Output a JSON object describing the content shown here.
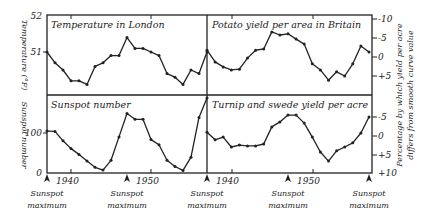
{
  "chart_data": {
    "type": "line",
    "x": [
      1937,
      1938,
      1939,
      1940,
      1941,
      1942,
      1943,
      1944,
      1945,
      1946,
      1947,
      1948,
      1949,
      1950,
      1951,
      1952,
      1953,
      1954,
      1955,
      1956,
      1957
    ],
    "x_tick_labels": [
      "1940",
      "1950"
    ],
    "sunspot_maxima_label": [
      "Sunspot",
      "maximum"
    ],
    "sunspot_maxima_x": [
      1937,
      1947,
      1957
    ],
    "panels": [
      {
        "id": "temperature",
        "title": "Temperature in London",
        "ylabel": "Temperature (°F)",
        "ytick_labels": [
          "52",
          "51"
        ],
        "ylim": [
          49.8,
          52
        ],
        "axis_side": "left",
        "values": [
          51.0,
          50.7,
          50.5,
          50.2,
          50.2,
          50.1,
          50.6,
          50.7,
          50.9,
          50.9,
          51.4,
          51.1,
          51.1,
          51.0,
          50.9,
          50.4,
          50.3,
          50.1,
          50.5,
          50.4,
          51.0
        ]
      },
      {
        "id": "potato",
        "title": "Potato yield per area in Britain",
        "ylabel": "Percentage by which yield per acre differs from smooth curve value",
        "ytick_labels": [
          "-10",
          "-5",
          "0",
          "+5"
        ],
        "ylim_inverted": [
          -10,
          7
        ],
        "axis_side": "right",
        "values": [
          -1.8,
          1.3,
          2.6,
          3.4,
          3.2,
          0.3,
          -1.8,
          -2.1,
          -6.6,
          -5.8,
          -6.1,
          -4.7,
          -3.4,
          1.8,
          3.4,
          6.1,
          3.9,
          5.0,
          1.8,
          -2.9,
          -1.3
        ]
      },
      {
        "id": "sunspot",
        "title": "Sunspot number",
        "ylabel": "Sunspot number",
        "ytick_labels": [
          "100",
          "0"
        ],
        "ylim": [
          0,
          200
        ],
        "axis_side": "left",
        "values": [
          105,
          104,
          80,
          60,
          45,
          28,
          12,
          5,
          30,
          90,
          150,
          135,
          135,
          83,
          70,
          30,
          14,
          4,
          38,
          140,
          190
        ]
      },
      {
        "id": "turnip",
        "title": "Turnip and swede yield per acre",
        "ylabel": "Percentage by which yield per acre differs from smooth curve value",
        "ytick_labels": [
          "-5",
          "0",
          "+5",
          "+10"
        ],
        "ylim_inverted": [
          -10,
          10
        ],
        "axis_side": "right",
        "values": [
          -1.0,
          1.0,
          0.3,
          2.9,
          2.4,
          2.6,
          2.6,
          2.1,
          -2.4,
          -3.7,
          -5.5,
          -5.5,
          -3.4,
          0.3,
          4.2,
          6.6,
          3.9,
          2.9,
          1.8,
          -0.8,
          -5.0
        ]
      }
    ],
    "right_axis_label_line1": "Percentage by which yield per acre",
    "right_axis_label_line2": "differs from smooth curve value"
  },
  "labels": {
    "temp_title": "Temperature in London",
    "potato_title": "Potato yield per area in Britain",
    "sunspot_title": "Sunspot number",
    "turnip_title": "Turnip and swede yield per acre",
    "temp_ylabel": "Temperature (°F)",
    "sunspot_ylabel": "Sunspot number",
    "right_ylabel_1": "Percentage by which yield per acre",
    "right_ylabel_2": "differs from smooth curve value",
    "y52": "52",
    "y51": "51",
    "y100": "100",
    "y0": "0",
    "pm10": "-10",
    "pm5": "-5",
    "p0": "0",
    "pp5": "+5",
    "tm5": "-5",
    "t0": "0",
    "tp5": "+5",
    "tp10": "+10",
    "x1940a": "1940",
    "x1950a": "1950",
    "x1940b": "1940",
    "x1950b": "1950",
    "sun1": "Sunspot",
    "max1": "maximum",
    "sun2": "Sunspot",
    "max2": "maximum",
    "sun3": "Sunspot",
    "max3": "maximum",
    "sun4": "Sunspot",
    "max4": "maximum",
    "sun5": "Sunspot",
    "max5": "maximum"
  }
}
